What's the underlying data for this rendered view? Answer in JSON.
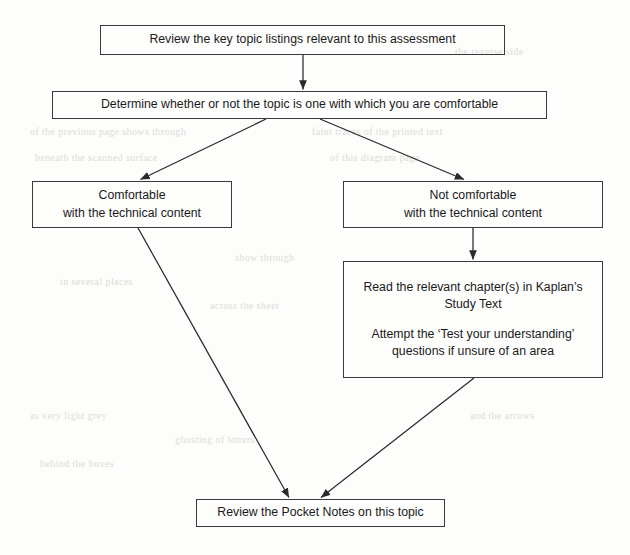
{
  "diagram": {
    "stroke_color": "#3a3a3a",
    "text_color": "#1a1a1a",
    "background_color": "#fdfdfc",
    "nodes": [
      {
        "id": "review-key-topics",
        "lines": [
          "Review the key topic listings relevant to this assessment"
        ]
      },
      {
        "id": "determine-comfort",
        "lines": [
          "Determine whether or not the topic is one with which you are comfortable"
        ]
      },
      {
        "id": "comfortable",
        "lines": [
          "Comfortable",
          "with the technical content"
        ]
      },
      {
        "id": "not-comfortable",
        "lines": [
          "Not comfortable",
          "with the technical content"
        ]
      },
      {
        "id": "read-study-text",
        "lines": [
          "Read the relevant chapter(s) in Kaplan’s",
          "Study Text",
          "",
          "Attempt the ‘Test your understanding’",
          "questions if unsure of an area"
        ]
      },
      {
        "id": "review-pocket-notes",
        "lines": [
          "Review the Pocket Notes on this topic"
        ]
      }
    ],
    "edges": [
      {
        "id": "edge-review-to-determine",
        "from": "review-key-topics",
        "to": "determine-comfort",
        "kind": "vertical-arrow"
      },
      {
        "id": "edge-determine-to-comfortable",
        "from": "determine-comfort",
        "to": "comfortable",
        "kind": "diagonal-arrow"
      },
      {
        "id": "edge-determine-to-not-comfortable",
        "from": "determine-comfort",
        "to": "not-comfortable",
        "kind": "diagonal-arrow"
      },
      {
        "id": "edge-not-comfortable-to-study-text",
        "from": "not-comfortable",
        "to": "read-study-text",
        "kind": "vertical-arrow"
      },
      {
        "id": "edge-comfortable-to-pocket-notes",
        "from": "comfortable",
        "to": "review-pocket-notes",
        "kind": "diagonal-arrow"
      },
      {
        "id": "edge-study-text-to-pocket-notes",
        "from": "read-study-text",
        "to": "review-pocket-notes",
        "kind": "diagonal-arrow"
      }
    ]
  },
  "background_artifacts": [
    {
      "text": "the reverse side",
      "x": 455,
      "y": 46
    },
    {
      "text": "of the previous page shows through",
      "x": 30,
      "y": 126
    },
    {
      "text": "faint traces of the printed text",
      "x": 312,
      "y": 126
    },
    {
      "text": "beneath the scanned surface",
      "x": 35,
      "y": 152
    },
    {
      "text": "of this diagram page",
      "x": 330,
      "y": 152
    },
    {
      "text": "show through",
      "x": 235,
      "y": 252
    },
    {
      "text": "in several places",
      "x": 60,
      "y": 276
    },
    {
      "text": "across the sheet",
      "x": 210,
      "y": 300
    },
    {
      "text": "as very light grey",
      "x": 30,
      "y": 410
    },
    {
      "text": "ghosting of letters",
      "x": 175,
      "y": 434
    },
    {
      "text": "behind the boxes",
      "x": 40,
      "y": 458
    },
    {
      "text": "and the arrows",
      "x": 470,
      "y": 410
    }
  ]
}
